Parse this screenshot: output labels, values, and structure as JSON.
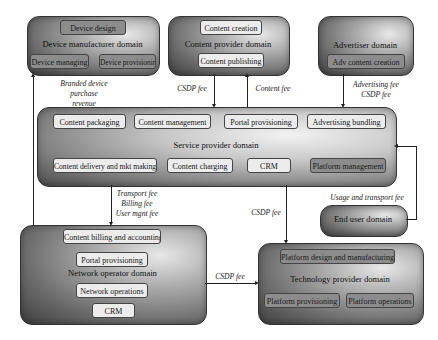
{
  "domains": {
    "device_manufacturer": {
      "label": "Device manufacturer domain",
      "items": [
        "Device design",
        "Device managing",
        "Device provisioning"
      ]
    },
    "content_provider": {
      "label": "Content provider domain",
      "items": [
        "Content creation",
        "Content publishing"
      ]
    },
    "advertiser": {
      "label": "Advertiser domain",
      "items": [
        "Adv content creation"
      ]
    },
    "service_provider": {
      "label": "Service provider domain",
      "items": [
        "Content packaging",
        "Content management",
        "Portal provisioning",
        "Advertising bundling",
        "Content delivery and mkt making",
        "Content charging",
        "CRM",
        "Platform management"
      ]
    },
    "end_user": {
      "label": "End user domain"
    },
    "network_operator": {
      "label": "Network operator domain",
      "items": [
        "Content billing and accounting",
        "Portal provisioning",
        "Network operations",
        "CRM"
      ]
    },
    "technology_provider": {
      "label": "Technology provider domain",
      "items": [
        "Platform design and manufacturing",
        "Platform provisioning",
        "Platform operations"
      ]
    }
  },
  "flows": {
    "branded_device": [
      "Branded device",
      "purchase",
      "revenue"
    ],
    "cp_csdp": "CSDP fee",
    "content_fee": "Content fee",
    "advertiser": [
      "Advertising fee",
      "CSDP fee"
    ],
    "network": [
      "Transport fee",
      "Billing  fee",
      "User mgnt fee"
    ],
    "sp_tech_csdp": "CSDP fee",
    "usage": "Usage and transport fee",
    "no_tech_csdp": "CSDP fee"
  }
}
